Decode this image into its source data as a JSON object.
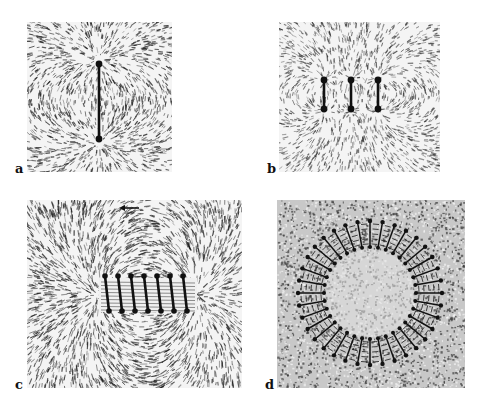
{
  "figure": {
    "panels": [
      {
        "label": "a",
        "subject": "single straight wire segment",
        "wire_count": 1
      },
      {
        "label": "b",
        "subject": "three parallel wire segments",
        "wire_count": 3
      },
      {
        "label": "c",
        "subject": "solenoid coil",
        "wire_count": 7
      },
      {
        "label": "d",
        "subject": "toroidal coil",
        "wire_count": 36
      }
    ]
  },
  "colors": {
    "background": "#ffffff",
    "filings": "#1a1a1a",
    "wire": "#111111",
    "panel_light": "#f4f4f4",
    "panel_dark": "#c8c8c8"
  }
}
